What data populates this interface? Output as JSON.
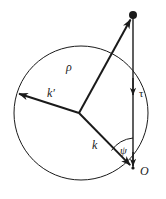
{
  "figure": {
    "name": "vector-geometry-diagram",
    "background_color": "#ffffff",
    "stroke_color": "#1a1a1a",
    "circle": {
      "name": "reference-circle",
      "cx": 81,
      "cy": 113,
      "r": 67,
      "stroke_width": 1
    },
    "points": {
      "center": {
        "label": "",
        "x": 79,
        "y": 113
      },
      "apex": {
        "label": "",
        "x": 133,
        "y": 15,
        "marker": "filled-dot",
        "radius": 4
      },
      "origin": {
        "label": "O",
        "x": 133,
        "y": 168
      },
      "k_prime_tip": {
        "label": "",
        "x": 16,
        "y": 93
      }
    },
    "vectors": [
      {
        "name": "rho-vector",
        "label": "ρ",
        "from_x": 79,
        "from_y": 113,
        "to_x": 133,
        "to_y": 15,
        "arrowhead": "end",
        "stroke_width": 2
      },
      {
        "name": "k-prime-vector",
        "label": "k′",
        "from_x": 79,
        "from_y": 113,
        "to_x": 16,
        "to_y": 93,
        "arrowhead": "end",
        "stroke_width": 2
      },
      {
        "name": "k-vector",
        "label": "k",
        "from_x": 79,
        "from_y": 113,
        "to_x": 133,
        "to_y": 168,
        "arrowhead": "end",
        "stroke_width": 2
      },
      {
        "name": "tau-vector",
        "label": "τ",
        "from_x": 133,
        "from_y": 15,
        "to_x": 133,
        "to_y": 168,
        "arrowhead": "mid-down",
        "arrowhead_y": 95,
        "stroke_width": 1.5
      }
    ],
    "angle": {
      "name": "psi-angle",
      "label": "ψ",
      "vertex_x": 133,
      "vertex_y": 168,
      "radius": 30,
      "between": [
        "tau-vector",
        "k-vector"
      ]
    },
    "labels": {
      "rho": "ρ",
      "k_prime": "k′",
      "k": "k",
      "tau": "τ",
      "psi": "ψ",
      "origin": "O"
    }
  }
}
